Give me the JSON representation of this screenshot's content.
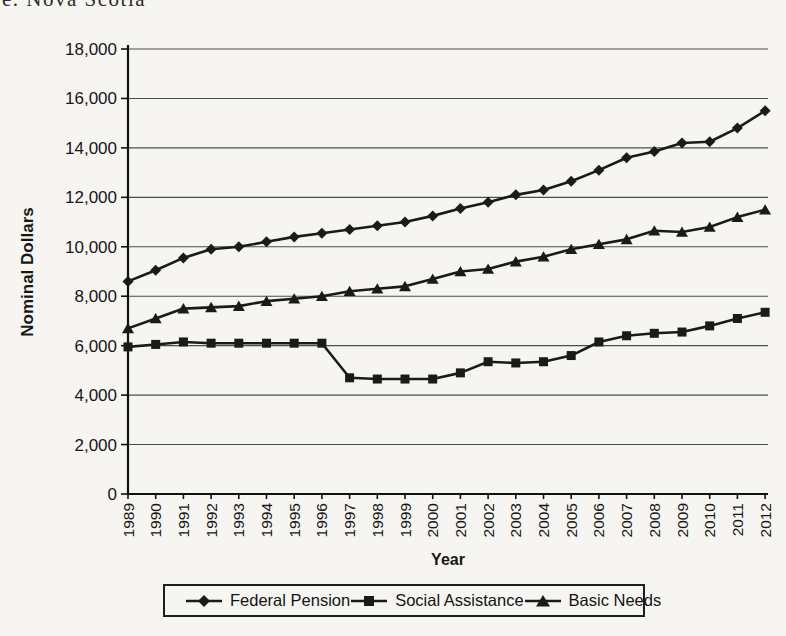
{
  "page": {
    "caption_partial": "e. Nova Scotia"
  },
  "chart_data": {
    "type": "line",
    "title": "",
    "xlabel": "Year",
    "ylabel": "Nominal Dollars",
    "ylim": [
      0,
      18000
    ],
    "y_tick_step": 2000,
    "grid": "horizontal",
    "legend_position": "bottom",
    "line_color": "#1a1a1a",
    "gridline_color": "#4d4d4d",
    "categories": [
      "1989",
      "1990",
      "1991",
      "1992",
      "1993",
      "1994",
      "1995",
      "1996",
      "1997",
      "1998",
      "1999",
      "2000",
      "2001",
      "2002",
      "2003",
      "2004",
      "2005",
      "2006",
      "2007",
      "2008",
      "2009",
      "2010",
      "2011",
      "2012"
    ],
    "series": [
      {
        "name": "Federal Pension",
        "marker": "diamond",
        "values": [
          8600,
          9050,
          9550,
          9900,
          10000,
          10200,
          10400,
          10550,
          10700,
          10850,
          11000,
          11250,
          11550,
          11800,
          12100,
          12300,
          12650,
          13100,
          13600,
          13850,
          14200,
          14250,
          14800,
          15500
        ]
      },
      {
        "name": "Social Assistance",
        "marker": "square",
        "values": [
          5950,
          6050,
          6150,
          6100,
          6100,
          6100,
          6100,
          6100,
          4700,
          4650,
          4650,
          4650,
          4900,
          5350,
          5300,
          5350,
          5600,
          6150,
          6400,
          6500,
          6550,
          6800,
          7100,
          7350
        ]
      },
      {
        "name": "Basic Needs",
        "marker": "triangle",
        "values": [
          6700,
          7100,
          7500,
          7550,
          7600,
          7800,
          7900,
          8000,
          8200,
          8300,
          8400,
          8700,
          9000,
          9100,
          9400,
          9600,
          9900,
          10100,
          10300,
          10650,
          10600,
          10800,
          11200,
          11500
        ]
      }
    ]
  }
}
